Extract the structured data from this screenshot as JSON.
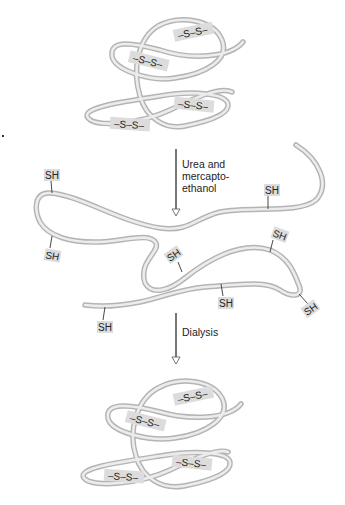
{
  "diagram": {
    "type": "protein denaturation and renaturation schematic",
    "colors": {
      "strand_outline": "#b4b4b4",
      "strand_fill": "#ececec",
      "label_background": "#dcdcdc",
      "text": "#222222",
      "arrow": "#777777"
    },
    "stages": [
      {
        "name": "native",
        "description": "Folded protein with disulfide bonds",
        "bonds": [
          {
            "label": "–S–S–"
          },
          {
            "label": "–S–S–"
          },
          {
            "label": "–S–S–"
          },
          {
            "label": "–S–S–"
          }
        ]
      },
      {
        "name": "denatured",
        "description": "Unfolded chain with free sulfhydryl groups",
        "groups": [
          {
            "label": "SH"
          },
          {
            "label": "SH"
          },
          {
            "label": "SH"
          },
          {
            "label": "SH"
          },
          {
            "label": "SH"
          },
          {
            "label": "SH"
          },
          {
            "label": "SH"
          },
          {
            "label": "SH"
          }
        ]
      },
      {
        "name": "renatured",
        "description": "Refolded protein with disulfide bonds restored",
        "bonds": [
          {
            "label": "–S–S–"
          },
          {
            "label": "–S–S–"
          },
          {
            "label": "–S–S–"
          },
          {
            "label": "–S–S–"
          }
        ]
      }
    ],
    "steps": [
      {
        "lines": [
          "Urea and",
          "mercapto-",
          "ethanol"
        ]
      },
      {
        "lines": [
          "Dialysis"
        ]
      }
    ]
  }
}
